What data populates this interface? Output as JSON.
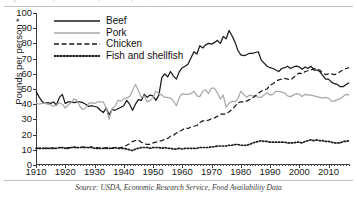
{
  "figure": {
    "top_caption_partial": "Figure. Per capita availability of beef, pork, chicken, and fish and shellfish",
    "source_note": "Source: USDA, Economic Research Service, Food Availability Data"
  },
  "axes": {
    "ylabel": "Pounds per person *",
    "yticks": [
      "0",
      "10",
      "20",
      "30",
      "40",
      "50",
      "60",
      "70",
      "80",
      "90",
      "100"
    ],
    "xticks": [
      "1910",
      "1920",
      "1930",
      "1940",
      "1950",
      "1960",
      "1970",
      "1980",
      "1990",
      "2000",
      "2010"
    ]
  },
  "legend": {
    "items": [
      {
        "label": "Beef",
        "key": "solid-black-line"
      },
      {
        "label": "Pork",
        "key": "solid-gray-line"
      },
      {
        "label": "Chicken",
        "key": "dashed-black-line"
      },
      {
        "label": "Fish and shellfish",
        "key": "dotted-black-line"
      }
    ]
  },
  "colors": {
    "beef": "#1a1a1a",
    "pork": "#a8a8a8",
    "chicken": "#1a1a1a",
    "fish": "#1a1a1a",
    "axis": "#3a3a3a"
  },
  "chart_data": {
    "type": "line",
    "title": "Per capita availability of beef, pork, chicken, and fish and shellfish",
    "xlabel": "",
    "ylabel": "Pounds per person *",
    "xlim": [
      1910,
      2017
    ],
    "ylim": [
      0,
      100
    ],
    "grid": false,
    "legend_position": "top-left",
    "x": [
      1910,
      1911,
      1912,
      1913,
      1914,
      1915,
      1916,
      1917,
      1918,
      1919,
      1920,
      1921,
      1922,
      1923,
      1924,
      1925,
      1926,
      1927,
      1928,
      1929,
      1930,
      1931,
      1932,
      1933,
      1934,
      1935,
      1936,
      1937,
      1938,
      1939,
      1940,
      1941,
      1942,
      1943,
      1944,
      1945,
      1946,
      1947,
      1948,
      1949,
      1950,
      1951,
      1952,
      1953,
      1954,
      1955,
      1956,
      1957,
      1958,
      1959,
      1960,
      1961,
      1962,
      1963,
      1964,
      1965,
      1966,
      1967,
      1968,
      1969,
      1970,
      1971,
      1972,
      1973,
      1974,
      1975,
      1976,
      1977,
      1978,
      1979,
      1980,
      1981,
      1982,
      1983,
      1984,
      1985,
      1986,
      1987,
      1988,
      1989,
      1990,
      1991,
      1992,
      1993,
      1994,
      1995,
      1996,
      1997,
      1998,
      1999,
      2000,
      2001,
      2002,
      2003,
      2004,
      2005,
      2006,
      2007,
      2008,
      2009,
      2010,
      2011,
      2012,
      2013,
      2014,
      2015,
      2016,
      2017
    ],
    "series": [
      {
        "name": "Beef",
        "style": "solid",
        "color": "#1a1a1a",
        "values": [
          48.5,
          45.0,
          42.0,
          40.5,
          41.0,
          40.5,
          41.5,
          39.5,
          44.5,
          46.5,
          40.5,
          41.5,
          41.5,
          41.0,
          41.5,
          41.5,
          41.0,
          40.0,
          38.5,
          39.0,
          38.5,
          38.0,
          36.0,
          34.5,
          37.5,
          33.0,
          36.5,
          36.0,
          37.0,
          38.0,
          39.0,
          42.5,
          40.0,
          36.0,
          40.0,
          43.0,
          42.5,
          46.5,
          44.5,
          46.0,
          45.5,
          42.5,
          46.0,
          57.5,
          60.0,
          58.0,
          61.5,
          58.5,
          56.5,
          61.5,
          64.0,
          65.0,
          66.5,
          70.5,
          74.5,
          73.0,
          78.5,
          77.0,
          79.0,
          80.0,
          79.5,
          80.5,
          82.0,
          80.0,
          84.5,
          83.0,
          88.5,
          85.0,
          81.0,
          75.5,
          72.5,
          72.0,
          72.5,
          73.5,
          73.5,
          74.0,
          74.5,
          69.0,
          67.0,
          65.0,
          64.0,
          63.5,
          62.5,
          61.5,
          63.5,
          64.0,
          65.0,
          63.5,
          64.5,
          65.0,
          64.5,
          63.0,
          64.5,
          63.5,
          65.0,
          62.5,
          62.5,
          61.5,
          59.0,
          56.5,
          56.5,
          54.5,
          53.5,
          53.0,
          51.5,
          51.5,
          53.0,
          54.0
        ]
      },
      {
        "name": "Pork",
        "style": "solid",
        "color": "#a8a8a8",
        "values": [
          41.0,
          40.0,
          40.5,
          40.5,
          40.0,
          39.5,
          38.5,
          39.5,
          41.0,
          40.0,
          37.5,
          39.5,
          41.0,
          43.5,
          42.5,
          38.5,
          36.5,
          37.5,
          40.5,
          41.0,
          40.5,
          41.5,
          41.5,
          41.5,
          37.5,
          30.0,
          37.0,
          38.5,
          42.5,
          42.0,
          43.5,
          44.0,
          45.0,
          49.0,
          53.0,
          49.0,
          44.5,
          45.5,
          41.5,
          42.5,
          44.5,
          48.5,
          47.0,
          46.0,
          44.5,
          44.5,
          44.0,
          42.0,
          39.0,
          44.5,
          47.0,
          46.5,
          46.5,
          47.0,
          48.5,
          45.5,
          45.0,
          48.5,
          49.5,
          47.0,
          50.5,
          50.5,
          47.5,
          43.5,
          46.0,
          38.0,
          40.5,
          42.0,
          41.5,
          43.5,
          48.5,
          46.5,
          44.5,
          46.0,
          45.5,
          45.5,
          44.5,
          44.5,
          46.0,
          47.5,
          46.0,
          46.5,
          48.5,
          48.5,
          48.0,
          47.5,
          45.5,
          45.0,
          46.0,
          47.0,
          46.5,
          45.0,
          46.5,
          46.0,
          46.0,
          45.5,
          45.0,
          44.5,
          44.0,
          44.5,
          44.0,
          42.0,
          42.0,
          43.0,
          43.5,
          45.0,
          46.5,
          46.0
        ]
      },
      {
        "name": "Chicken",
        "style": "dashed",
        "color": "#1a1a1a",
        "values": [
          11.0,
          11.0,
          11.5,
          11.0,
          11.0,
          11.5,
          11.0,
          11.0,
          11.5,
          11.5,
          11.0,
          11.5,
          11.5,
          12.0,
          11.5,
          11.5,
          12.0,
          11.5,
          11.5,
          12.0,
          11.5,
          11.5,
          11.0,
          11.0,
          11.5,
          11.0,
          11.0,
          11.5,
          11.0,
          11.5,
          12.0,
          13.0,
          14.0,
          15.5,
          16.0,
          16.5,
          15.0,
          14.0,
          13.5,
          13.5,
          14.5,
          15.0,
          15.5,
          16.0,
          17.0,
          17.5,
          19.0,
          19.5,
          21.0,
          22.0,
          23.0,
          24.5,
          24.0,
          25.0,
          25.5,
          26.0,
          28.0,
          29.0,
          29.0,
          29.5,
          30.5,
          31.0,
          32.0,
          33.5,
          33.5,
          33.5,
          35.0,
          36.5,
          38.5,
          41.0,
          41.5,
          41.5,
          42.0,
          43.0,
          44.0,
          45.5,
          47.0,
          48.5,
          49.5,
          50.0,
          52.5,
          53.5,
          55.0,
          56.0,
          56.5,
          57.0,
          56.5,
          56.0,
          57.5,
          59.5,
          60.5,
          60.0,
          61.5,
          62.0,
          62.5,
          63.5,
          63.0,
          62.5,
          60.5,
          59.5,
          60.0,
          60.0,
          59.5,
          60.0,
          61.5,
          62.5,
          63.5,
          64.0
        ]
      },
      {
        "name": "Fish and shellfish",
        "style": "dotted",
        "color": "#1a1a1a",
        "values": [
          11.0,
          11.0,
          11.0,
          11.0,
          11.0,
          11.0,
          11.0,
          11.0,
          11.5,
          11.5,
          11.0,
          11.0,
          11.5,
          11.5,
          11.5,
          11.5,
          11.5,
          11.5,
          11.5,
          11.5,
          11.0,
          11.0,
          11.0,
          11.0,
          11.0,
          11.0,
          11.0,
          11.5,
          11.0,
          11.0,
          11.0,
          10.5,
          10.0,
          9.5,
          10.5,
          11.0,
          11.5,
          11.5,
          11.5,
          11.0,
          11.5,
          11.5,
          11.5,
          11.0,
          11.5,
          11.0,
          11.0,
          10.5,
          10.5,
          11.0,
          10.5,
          11.0,
          11.0,
          11.0,
          11.0,
          11.0,
          11.5,
          11.5,
          11.5,
          11.5,
          12.0,
          12.0,
          12.5,
          12.5,
          12.5,
          12.5,
          13.0,
          13.0,
          13.5,
          13.5,
          13.0,
          13.0,
          13.0,
          13.5,
          14.5,
          15.0,
          15.5,
          16.0,
          15.5,
          15.5,
          15.0,
          15.0,
          15.0,
          15.0,
          15.0,
          15.0,
          14.5,
          14.5,
          14.5,
          15.0,
          15.0,
          14.5,
          15.5,
          16.0,
          16.5,
          16.0,
          16.5,
          16.0,
          16.0,
          15.5,
          15.5,
          15.0,
          14.5,
          14.5,
          14.5,
          15.5,
          15.5,
          16.0
        ]
      }
    ]
  }
}
